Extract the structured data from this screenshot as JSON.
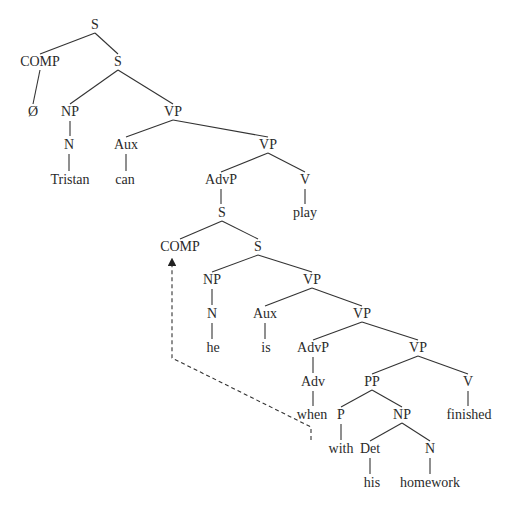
{
  "diagram": {
    "type": "syntax-tree",
    "nodes": [
      {
        "id": "s_root",
        "label": "S",
        "x": 95,
        "y": 25
      },
      {
        "id": "comp1",
        "label": "COMP",
        "x": 40,
        "y": 62
      },
      {
        "id": "s1",
        "label": "S",
        "x": 118,
        "y": 62
      },
      {
        "id": "null1",
        "label": "Ø",
        "x": 33,
        "y": 112
      },
      {
        "id": "np1",
        "label": "NP",
        "x": 70,
        "y": 112
      },
      {
        "id": "vp1",
        "label": "VP",
        "x": 173,
        "y": 112
      },
      {
        "id": "n1",
        "label": "N",
        "x": 69,
        "y": 145
      },
      {
        "id": "aux1",
        "label": "Aux",
        "x": 126,
        "y": 145
      },
      {
        "id": "vp2",
        "label": "VP",
        "x": 268,
        "y": 145
      },
      {
        "id": "tristan",
        "label": "Tristan",
        "x": 70,
        "y": 180
      },
      {
        "id": "can",
        "label": "can",
        "x": 125,
        "y": 180
      },
      {
        "id": "advp1",
        "label": "AdvP",
        "x": 221,
        "y": 180
      },
      {
        "id": "v1",
        "label": "V",
        "x": 305,
        "y": 180
      },
      {
        "id": "s2",
        "label": "S",
        "x": 222,
        "y": 213
      },
      {
        "id": "play",
        "label": "play",
        "x": 305,
        "y": 213
      },
      {
        "id": "comp2",
        "label": "COMP",
        "x": 180,
        "y": 247
      },
      {
        "id": "s3",
        "label": "S",
        "x": 258,
        "y": 247
      },
      {
        "id": "np2",
        "label": "NP",
        "x": 212,
        "y": 280
      },
      {
        "id": "vp3",
        "label": "VP",
        "x": 312,
        "y": 280
      },
      {
        "id": "n2",
        "label": "N",
        "x": 212,
        "y": 314
      },
      {
        "id": "aux2",
        "label": "Aux",
        "x": 265,
        "y": 314
      },
      {
        "id": "vp4",
        "label": "VP",
        "x": 362,
        "y": 314
      },
      {
        "id": "he",
        "label": "he",
        "x": 213,
        "y": 348
      },
      {
        "id": "is",
        "label": "is",
        "x": 266,
        "y": 348
      },
      {
        "id": "advp2",
        "label": "AdvP",
        "x": 313,
        "y": 348
      },
      {
        "id": "vp5",
        "label": "VP",
        "x": 418,
        "y": 348
      },
      {
        "id": "adv",
        "label": "Adv",
        "x": 313,
        "y": 382
      },
      {
        "id": "pp",
        "label": "PP",
        "x": 372,
        "y": 382
      },
      {
        "id": "v2",
        "label": "V",
        "x": 468,
        "y": 382
      },
      {
        "id": "when",
        "label": "when",
        "x": 312,
        "y": 415
      },
      {
        "id": "p",
        "label": "P",
        "x": 341,
        "y": 415
      },
      {
        "id": "np3",
        "label": "NP",
        "x": 402,
        "y": 415
      },
      {
        "id": "finished",
        "label": "finished",
        "x": 469,
        "y": 415
      },
      {
        "id": "with",
        "label": "with",
        "x": 341,
        "y": 449
      },
      {
        "id": "det",
        "label": "Det",
        "x": 370,
        "y": 449
      },
      {
        "id": "n3",
        "label": "N",
        "x": 430,
        "y": 449
      },
      {
        "id": "his",
        "label": "his",
        "x": 372,
        "y": 483
      },
      {
        "id": "homework",
        "label": "homework",
        "x": 430,
        "y": 483
      }
    ],
    "edges": [
      [
        "s_root",
        "comp1"
      ],
      [
        "s_root",
        "s1"
      ],
      [
        "comp1",
        "null1"
      ],
      [
        "s1",
        "np1"
      ],
      [
        "s1",
        "vp1"
      ],
      [
        "np1",
        "n1"
      ],
      [
        "n1",
        "tristan"
      ],
      [
        "vp1",
        "aux1"
      ],
      [
        "vp1",
        "vp2"
      ],
      [
        "aux1",
        "can"
      ],
      [
        "vp2",
        "advp1"
      ],
      [
        "vp2",
        "v1"
      ],
      [
        "advp1",
        "s2"
      ],
      [
        "v1",
        "play"
      ],
      [
        "s2",
        "comp2"
      ],
      [
        "s2",
        "s3"
      ],
      [
        "s3",
        "np2"
      ],
      [
        "s3",
        "vp3"
      ],
      [
        "np2",
        "n2"
      ],
      [
        "n2",
        "he"
      ],
      [
        "vp3",
        "aux2"
      ],
      [
        "vp3",
        "vp4"
      ],
      [
        "aux2",
        "is"
      ],
      [
        "vp4",
        "advp2"
      ],
      [
        "vp4",
        "vp5"
      ],
      [
        "advp2",
        "adv"
      ],
      [
        "adv",
        "when"
      ],
      [
        "vp5",
        "pp"
      ],
      [
        "vp5",
        "v2"
      ],
      [
        "v2",
        "finished"
      ],
      [
        "pp",
        "p"
      ],
      [
        "pp",
        "np3"
      ],
      [
        "p",
        "with"
      ],
      [
        "np3",
        "det"
      ],
      [
        "np3",
        "n3"
      ],
      [
        "det",
        "his"
      ],
      [
        "n3",
        "homework"
      ]
    ],
    "movement_arrow": {
      "from": "when",
      "to": "comp2",
      "style": "dashed",
      "points": [
        [
          311,
          440
        ],
        [
          311,
          427
        ],
        [
          172,
          358
        ],
        [
          172,
          262
        ]
      ]
    }
  }
}
